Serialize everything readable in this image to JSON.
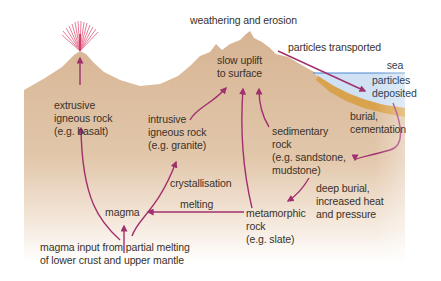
{
  "diagram": {
    "colors": {
      "land": "#d8b898",
      "land_fade": "#ffffff",
      "sea": "#cfe1f3",
      "sea_line": "#4a86c8",
      "sediment_layer": "#d9a24c",
      "arrow": "#a0306e",
      "text": "#3a3128",
      "eruption": "#e8708e"
    },
    "labels": {
      "weathering": "weathering and erosion",
      "transported": "particles transported",
      "sea": "sea",
      "deposited": "particles\ndeposited",
      "uplift": "slow uplift\nto surface",
      "extrusive": "extrusive\nigneous rock\n(e.g. basalt)",
      "intrusive": "intrusive\nigneous rock\n(e.g. granite)",
      "sedimentary": "sedimentary\nrock\n(e.g. sandstone,\nmudstone)",
      "burial": "burial,\ncementation",
      "deep_burial": "deep burial,\nincreased heat\nand pressure",
      "crystallisation": "crystallisation",
      "melting": "melting",
      "magma": "magma",
      "metamorphic": "metamorphic\nrock\n(e.g. slate)",
      "magma_input": "magma input from partial melting\nof lower crust and upper mantle"
    },
    "arrows": [
      {
        "from": "magma",
        "to": "extrusive igneous rock"
      },
      {
        "from": "magma",
        "to": "intrusive igneous rock",
        "label": "crystallisation"
      },
      {
        "from": "intrusive igneous rock",
        "to": "slow uplift to surface"
      },
      {
        "from": "metamorphic rock",
        "to": "slow uplift to surface"
      },
      {
        "from": "sedimentary rock",
        "to": "slow uplift to surface"
      },
      {
        "from": "weathering and erosion",
        "to": "particles deposited",
        "label": "particles transported"
      },
      {
        "from": "particles deposited",
        "to": "sedimentary rock",
        "label": "burial, cementation"
      },
      {
        "from": "sedimentary rock",
        "to": "metamorphic rock",
        "label": "deep burial, increased heat and pressure"
      },
      {
        "from": "metamorphic rock",
        "to": "magma",
        "label": "melting"
      },
      {
        "from": "lower crust and upper mantle",
        "to": "magma",
        "label": "magma input from partial melting"
      },
      {
        "from": "extrusive volcano vent",
        "to": "eruption"
      }
    ]
  }
}
